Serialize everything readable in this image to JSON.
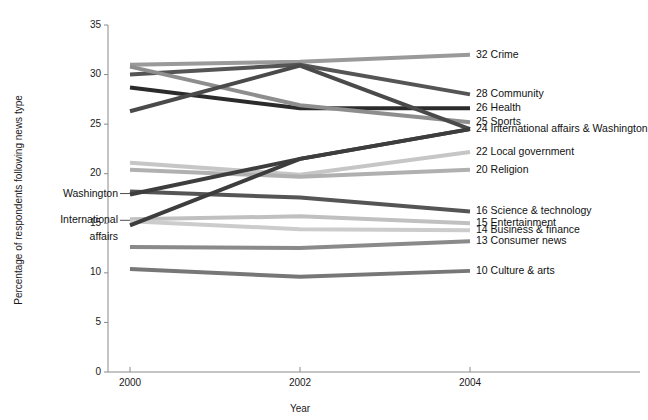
{
  "chart_data": {
    "type": "line",
    "title": "",
    "xlabel": "Year",
    "ylabel": "Percentage of respondents following news type",
    "x": [
      2000,
      2002,
      2004
    ],
    "xticklabels": [
      "2000",
      "2002",
      "2004"
    ],
    "yticks": [
      0,
      5,
      10,
      15,
      20,
      25,
      30,
      35
    ],
    "yticklabels": [
      "0",
      "5",
      "10",
      "15",
      "20",
      "25",
      "30",
      "35"
    ],
    "ylim": [
      0,
      35
    ],
    "xlim": [
      1999.55,
      2004.4
    ],
    "grid": false,
    "legend_position": "right-of-endpoints",
    "series": [
      {
        "name": "Crime",
        "end_value": 32,
        "label": "32 Crime",
        "values": [
          31.0,
          31.3,
          32.0
        ],
        "color": "#9a9a9a",
        "width": 4.0
      },
      {
        "name": "Community",
        "end_value": 28,
        "label": "28 Community",
        "values": [
          30.0,
          31.0,
          28.0
        ],
        "color": "#555555",
        "width": 4.0
      },
      {
        "name": "Health",
        "end_value": 26,
        "label": "26 Health",
        "values": [
          28.7,
          26.6,
          26.6
        ],
        "color": "#2b2b2b",
        "width": 4.0
      },
      {
        "name": "Sports",
        "end_value": 25,
        "label": "25 Sports",
        "values": [
          30.8,
          26.9,
          25.2
        ],
        "color": "#8e8e8e",
        "width": 4.0
      },
      {
        "name": "International affairs & Washington",
        "end_value": 24,
        "label": "24 International affairs & Washington",
        "values": [
          26.3,
          30.9,
          24.5
        ],
        "color": "#4a4a4a",
        "width": 4.0
      },
      {
        "name": "Local government",
        "end_value": 22,
        "label": "22 Local government",
        "values": [
          21.1,
          19.9,
          22.2
        ],
        "color": "#c6c6c6",
        "width": 4.0
      },
      {
        "name": "Religion",
        "end_value": 20,
        "label": "20 Religion",
        "values": [
          20.4,
          19.7,
          20.4
        ],
        "color": "#b0b0b0",
        "width": 4.0
      },
      {
        "name": "Science & technology",
        "end_value": 16,
        "label": "16 Science & technology",
        "values": [
          18.2,
          17.6,
          16.2
        ],
        "color": "#555555",
        "width": 4.0
      },
      {
        "name": "Entertainment",
        "end_value": 15,
        "label": "15 Entertainment",
        "values": [
          15.4,
          15.7,
          15.0
        ],
        "color": "#c0c0c0",
        "width": 4.0
      },
      {
        "name": "Business & finance",
        "end_value": 14,
        "label": "14 Business & finance",
        "values": [
          15.2,
          14.4,
          14.3
        ],
        "color": "#cccccc",
        "width": 4.0
      },
      {
        "name": "Consumer news",
        "end_value": 13,
        "label": "13 Consumer news",
        "values": [
          12.6,
          12.5,
          13.2
        ],
        "color": "#8a8a8a",
        "width": 4.0
      },
      {
        "name": "Culture & arts",
        "end_value": 10,
        "label": "10 Culture & arts",
        "values": [
          10.4,
          9.6,
          10.2
        ],
        "color": "#777777",
        "width": 4.0
      },
      {
        "name": "Washington (rising)",
        "end_value": null,
        "label": "",
        "values": [
          14.8,
          21.5,
          24.5
        ],
        "color": "#3d3d3d",
        "width": 4.0
      },
      {
        "name": "International affairs (rising)",
        "end_value": null,
        "label": "",
        "values": [
          17.9,
          21.5,
          24.5
        ],
        "color": "#3d3d3d",
        "width": 4.0
      }
    ],
    "annotations": [
      {
        "name": "washington",
        "text": "Washington",
        "x": 2000,
        "y": 18.0
      },
      {
        "name": "international-affairs-line1",
        "text": "International",
        "x": 2000,
        "y": 15.3
      },
      {
        "name": "international-affairs-line2",
        "text": "affairs",
        "x": 2000,
        "y": 13.6
      }
    ]
  }
}
